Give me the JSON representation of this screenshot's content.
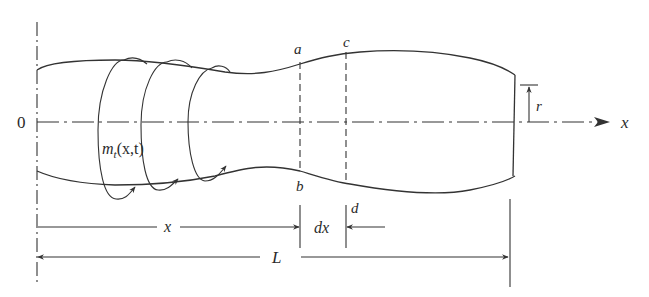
{
  "figure": {
    "colors": {
      "line": "#333333",
      "text": "#2a2a2a",
      "background": "#ffffff"
    }
  },
  "labels": {
    "origin": "0",
    "axis_x": "x",
    "radius": "r",
    "torque_m": "m",
    "torque_sub": "t",
    "torque_args": "(x,t)",
    "point_a": "a",
    "point_b": "b",
    "point_c": "c",
    "point_d": "d",
    "dim_x": "x",
    "dim_dx": "dx",
    "dim_L": "L"
  },
  "dimensions": [
    {
      "name": "x",
      "from": "0",
      "to": "section ab"
    },
    {
      "name": "dx",
      "from": "section ab",
      "to": "section cd"
    },
    {
      "name": "L",
      "from": "0",
      "to": "right end"
    }
  ]
}
